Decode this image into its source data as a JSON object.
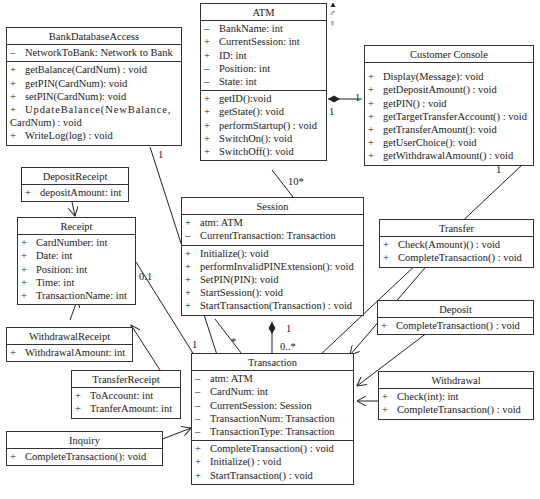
{
  "classes": {
    "bankdb": {
      "name": "BankDatabaseAccess",
      "attributes": [
        {
          "v": "–",
          "t": "NetworkToBank: Network to Bank"
        }
      ],
      "methods": [
        {
          "v": "+",
          "t": "getBalance(CardNum) : void"
        },
        {
          "v": "+",
          "t": "getPIN(CardNum): void"
        },
        {
          "v": "+",
          "t": "setPIN(CardNum): void"
        },
        {
          "v": "+",
          "t": "UpdateBalance(NewBalance,"
        },
        {
          "v": "",
          "t": "CardNum) : void"
        },
        {
          "v": "+",
          "t": "WriteLog(log) : void"
        }
      ]
    },
    "atm": {
      "name": "ATM",
      "attributes": [
        {
          "v": "–",
          "t": "BankName: int"
        },
        {
          "v": "+",
          "t": "CurrentSession: int"
        },
        {
          "v": "+",
          "t": "ID: int"
        },
        {
          "v": "–",
          "t": "Position: int"
        },
        {
          "v": "–",
          "t": "State: int"
        }
      ],
      "methods": [
        {
          "v": "+",
          "t": "getID():void"
        },
        {
          "v": "+",
          "t": "getState(): void"
        },
        {
          "v": "+",
          "t": "performStartup() : void"
        },
        {
          "v": "+",
          "t": "SwitchOn(): void"
        },
        {
          "v": "+",
          "t": "SwitchOff(): void"
        }
      ]
    },
    "console": {
      "name": "Customer Console",
      "attributes": [],
      "methods": [
        {
          "v": "+",
          "t": "Display(Message): void"
        },
        {
          "v": "+",
          "t": "getDepositAmount() : void"
        },
        {
          "v": "+",
          "t": "getPIN() : void"
        },
        {
          "v": "+",
          "t": "getTargetTransferAccount() : void"
        },
        {
          "v": "+",
          "t": "getTransferAmount(): void"
        },
        {
          "v": "+",
          "t": "getUserChoice(): void"
        },
        {
          "v": "+",
          "t": "getWithdrawalAmount() : void"
        }
      ]
    },
    "depositReceipt": {
      "name": "DepositReceipt",
      "attributes": [
        {
          "v": "+",
          "t": "depositAmount: int"
        }
      ]
    },
    "receipt": {
      "name": "Receipt",
      "attributes": [
        {
          "v": "+",
          "t": "CardNumber: int"
        },
        {
          "v": "+",
          "t": "Date: int"
        },
        {
          "v": "+",
          "t": "Position: int"
        },
        {
          "v": "+",
          "t": "Time: int"
        },
        {
          "v": "+",
          "t": "TransactionName: int"
        }
      ]
    },
    "session": {
      "name": "Session",
      "attributes": [
        {
          "v": "+",
          "t": "atm: ATM"
        },
        {
          "v": "–",
          "t": "CurrentTransaction: Transaction"
        }
      ],
      "methods": [
        {
          "v": "+",
          "t": "Initialize(): void"
        },
        {
          "v": "+",
          "t": "performInvalidPINExtension(): void"
        },
        {
          "v": "+",
          "t": "SetPIN(PIN): void"
        },
        {
          "v": "+",
          "t": "StartSession(): void"
        },
        {
          "v": "+",
          "t": "StartTransaction(Transaction) : void"
        }
      ]
    },
    "transfer": {
      "name": "Transfer",
      "methods": [
        {
          "v": "+",
          "t": "Check(Amount)() : void"
        },
        {
          "v": "+",
          "t": "CompleteTransaction() : void"
        }
      ]
    },
    "deposit": {
      "name": "Deposit",
      "methods": [
        {
          "v": "+",
          "t": "CompleteTransaction() : void"
        }
      ]
    },
    "withdrawalReceipt": {
      "name": "WithdrawalReceipt",
      "attributes": [
        {
          "v": "+",
          "t": "WithdrawalAmount: int"
        }
      ]
    },
    "transferReceipt": {
      "name": "TransferReceipt",
      "attributes": [
        {
          "v": "+",
          "t": "ToAccount: int"
        },
        {
          "v": "+",
          "t": "TranferAmount: int"
        }
      ]
    },
    "transaction": {
      "name": "Transaction",
      "attributes": [
        {
          "v": "–",
          "t": "atm: ATM"
        },
        {
          "v": "–",
          "t": "CardNum: int"
        },
        {
          "v": "–",
          "t": "CurrentSession: Session"
        },
        {
          "v": "–",
          "t": "TransactionNum: Transaction"
        },
        {
          "v": "–",
          "t": "TransactionType: Transaction"
        }
      ],
      "methods": [
        {
          "v": "+",
          "t": "CompleteTransaction() : void"
        },
        {
          "v": "+",
          "t": "Initialize() : void"
        },
        {
          "v": "+",
          "t": "StartTransaction() : void"
        }
      ]
    },
    "withdrawal": {
      "name": "Withdrawal",
      "methods": [
        {
          "v": "+",
          "t": "Check(int): int"
        },
        {
          "v": "+",
          "t": "CompleteTransaction() : void"
        }
      ]
    },
    "inquiry": {
      "name": "Inquiry",
      "methods": [
        {
          "v": "+",
          "t": "CompleteTransaction(): void"
        }
      ]
    }
  },
  "multiplicities": {
    "atm_console_console": "1",
    "atm_console_atm": "1",
    "atm_session": "10*",
    "bankdb_transaction": "1",
    "console_transaction": "1",
    "receipt_transaction_receipt": "0.1",
    "receipt_transaction_transaction": "1",
    "session_transaction_session": "1",
    "session_transaction_transaction": "0..*",
    "session_star": "*"
  },
  "legend_glyphs": [
    "▲",
    "♂",
    "♀"
  ]
}
